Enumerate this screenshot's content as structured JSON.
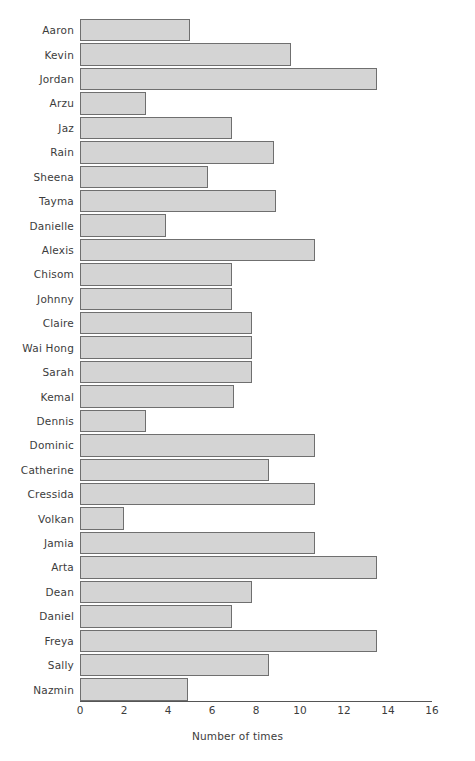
{
  "chart_data": {
    "type": "bar",
    "orientation": "horizontal",
    "title": "",
    "xlabel": "Number of times",
    "ylabel": "",
    "xlim": [
      0,
      16
    ],
    "xticks": [
      0,
      2,
      4,
      6,
      8,
      10,
      12,
      14,
      16
    ],
    "grid": false,
    "legend": null,
    "bar_color": "#d4d4d4",
    "bar_edge_color": "#6f6f6f",
    "categories": [
      "Aaron",
      "Kevin",
      "Jordan",
      "Arzu",
      "Jaz",
      "Rain",
      "Sheena",
      "Tayma",
      "Danielle",
      "Alexis",
      "Chisom",
      "Johnny",
      "Claire",
      "Wai Hong",
      "Sarah",
      "Kemal",
      "Dennis",
      "Dominic",
      "Catherine",
      "Cressida",
      "Volkan",
      "Jamia",
      "Arta",
      "Dean",
      "Daniel",
      "Freya",
      "Sally",
      "Nazmin"
    ],
    "values": [
      5,
      9.6,
      13.5,
      3,
      6.9,
      8.8,
      5.8,
      8.9,
      3.9,
      10.7,
      6.9,
      6.9,
      7.8,
      7.8,
      7.8,
      7,
      3,
      10.7,
      8.6,
      10.7,
      2,
      10.7,
      13.5,
      7.8,
      6.9,
      13.5,
      8.6,
      4.9
    ]
  }
}
